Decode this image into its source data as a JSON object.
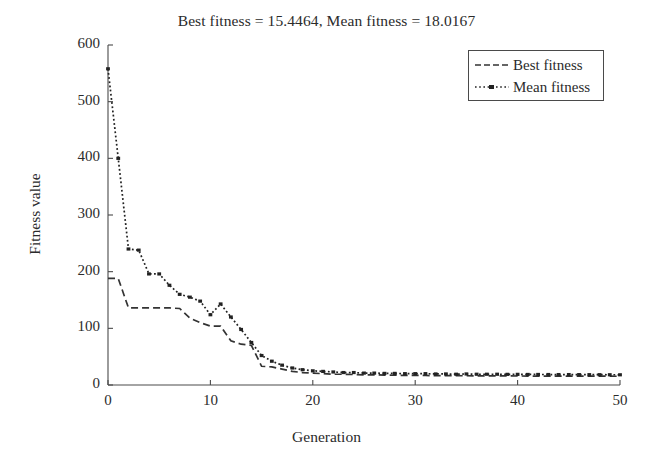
{
  "chart_data": {
    "type": "line",
    "title": "Best fitness = 15.4464, Mean fitness = 18.0167",
    "xlabel": "Generation",
    "ylabel": "Fitness value",
    "xlim": [
      0,
      50
    ],
    "ylim": [
      0,
      600
    ],
    "xticks": [
      0,
      10,
      20,
      30,
      40,
      50
    ],
    "yticks": [
      0,
      100,
      200,
      300,
      400,
      500,
      600
    ],
    "grid": false,
    "legend_position": "top-right",
    "x": [
      0,
      1,
      2,
      3,
      4,
      5,
      6,
      7,
      8,
      9,
      10,
      11,
      12,
      13,
      14,
      15,
      16,
      17,
      18,
      19,
      20,
      21,
      22,
      23,
      24,
      25,
      26,
      27,
      28,
      29,
      30,
      31,
      32,
      33,
      34,
      35,
      36,
      37,
      38,
      39,
      40,
      41,
      42,
      43,
      44,
      45,
      46,
      47,
      48,
      49,
      50
    ],
    "series": [
      {
        "name": "Best fitness",
        "style": "dashed",
        "color": "#333333",
        "final_value": 15.4464,
        "values": [
          188,
          188,
          136,
          136,
          136,
          136,
          136,
          135,
          118,
          110,
          104,
          104,
          78,
          72,
          70,
          33,
          32,
          28,
          24,
          22,
          21,
          20,
          19,
          19,
          18.5,
          18,
          18,
          17.5,
          17.2,
          17,
          17,
          16.8,
          16.6,
          16.5,
          16.4,
          16.3,
          16.2,
          16.1,
          16.0,
          16.0,
          15.9,
          15.8,
          15.8,
          15.7,
          15.7,
          15.6,
          15.6,
          15.5,
          15.5,
          15.5,
          15.4464
        ]
      },
      {
        "name": "Mean fitness",
        "style": "dash-dot",
        "color": "#222222",
        "final_value": 18.0167,
        "values": [
          558,
          400,
          240,
          238,
          196,
          196,
          176,
          160,
          155,
          148,
          124,
          143,
          120,
          98,
          75,
          52,
          42,
          35,
          30,
          27,
          25,
          24,
          23,
          22,
          22,
          21,
          21,
          20.5,
          20.5,
          20,
          20,
          20,
          19.5,
          19.5,
          19,
          19.5,
          19,
          19,
          19,
          18.8,
          18.8,
          18.6,
          18.6,
          18.5,
          18.4,
          18.4,
          18.3,
          18.2,
          18.2,
          18.1,
          18.0167
        ]
      }
    ]
  },
  "legend": {
    "items": [
      {
        "label": "Best fitness"
      },
      {
        "label": "Mean fitness"
      }
    ]
  },
  "axes": {
    "x_tick_labels": [
      "0",
      "10",
      "20",
      "30",
      "40",
      "50"
    ],
    "y_tick_labels": [
      "0",
      "100",
      "200",
      "300",
      "400",
      "500",
      "600"
    ]
  },
  "colors": {
    "axis": "#4a4a4a",
    "text": "#2b2b2b",
    "best_series": "#333333",
    "mean_series": "#222222",
    "background": "#ffffff"
  }
}
